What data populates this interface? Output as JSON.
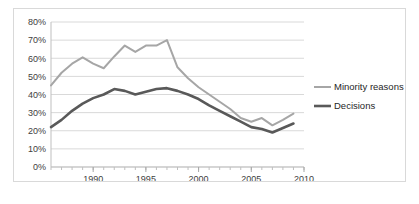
{
  "chart_data": {
    "type": "line",
    "title": "",
    "xlabel": "",
    "ylabel": "",
    "xlim": [
      1986,
      2010
    ],
    "ylim": [
      0,
      80
    ],
    "grid": true,
    "grid_axis": "y",
    "legend_position": "right",
    "y_ticks": [
      0,
      10,
      20,
      30,
      40,
      50,
      60,
      70,
      80
    ],
    "y_tick_labels": [
      "0%",
      "10%",
      "20%",
      "30%",
      "40%",
      "50%",
      "60%",
      "70%",
      "80%"
    ],
    "x_ticks_major": [
      1990,
      1995,
      2000,
      2005,
      2010
    ],
    "x_tick_labels": [
      "1990",
      "1995",
      "2000",
      "2005",
      "2010"
    ],
    "x_tick_minor_step": 1,
    "x": [
      1986,
      1987,
      1988,
      1989,
      1990,
      1991,
      1992,
      1993,
      1994,
      1995,
      1996,
      1997,
      1998,
      1999,
      2000,
      2001,
      2002,
      2003,
      2004,
      2005,
      2006,
      2007,
      2008,
      2009
    ],
    "series": [
      {
        "name": "Minority reasons",
        "color": "#a6a6a6",
        "width": 2,
        "values": [
          45,
          52,
          57,
          60.5,
          57,
          54.5,
          61,
          67,
          63.5,
          67,
          67,
          70,
          55,
          49,
          44,
          40,
          36,
          32,
          27,
          25,
          27,
          23,
          26,
          29.5
        ]
      },
      {
        "name": "Decisions",
        "color": "#595959",
        "width": 2.6,
        "values": [
          22,
          26,
          31,
          35,
          38,
          40,
          43,
          42,
          40,
          41.5,
          43,
          43.5,
          42,
          40,
          37.5,
          34,
          31,
          28,
          25,
          22,
          21,
          19,
          21.5,
          24
        ]
      }
    ]
  },
  "legend": {
    "items": [
      {
        "label": "Minority reasons",
        "color": "#a6a6a6"
      },
      {
        "label": "Decisions",
        "color": "#595959"
      }
    ]
  }
}
